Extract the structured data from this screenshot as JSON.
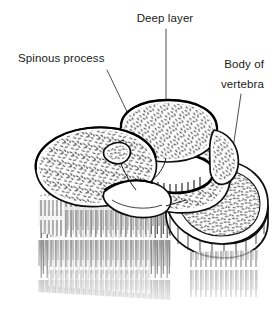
{
  "figure": {
    "kind": "anatomical-line-drawing",
    "style": "black-and-white stippled engraving",
    "background_color": "#ffffff",
    "ink_color": "#0d0d0d",
    "stipple_color": "#4a4a4a",
    "leader_color": "#3a3a3a"
  },
  "labels": {
    "deep_layer": {
      "text": "Deep layer",
      "x": 165,
      "y": 22,
      "anchor": "middle"
    },
    "spinous_process": {
      "text": "Spinous process",
      "x": 18,
      "y": 62,
      "anchor": "start"
    },
    "body_of_vertebra": {
      "line1": "Body of",
      "line2": "vertebra",
      "x": 264,
      "y1": 68,
      "y2": 88,
      "anchor": "end"
    }
  },
  "leaders": [
    {
      "name": "deep-layer-leader",
      "path": "M166,29 L166,116"
    },
    {
      "name": "spinous-process-leader",
      "path": "M107,70 L142,143"
    },
    {
      "name": "body-of-vertebra-leader",
      "path": "M241,94 L226,196"
    }
  ],
  "structures": [
    {
      "name": "deep-layer-lobe",
      "region": "upper-center"
    },
    {
      "name": "spinous-process-lobe",
      "region": "left"
    },
    {
      "name": "vertebral-body-disc",
      "region": "right"
    },
    {
      "name": "vertebral-canal",
      "region": "center"
    },
    {
      "name": "muscle-fiber-hatching",
      "region": "lower"
    }
  ]
}
